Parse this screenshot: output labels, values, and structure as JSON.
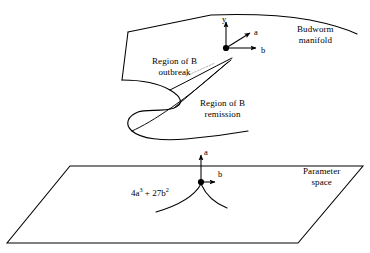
{
  "figure": {
    "stroke_color": "#000000",
    "background_color": "#ffffff",
    "labels": {
      "budworm_manifold_line1": "Budworm",
      "budworm_manifold_line2": "manifold",
      "region_outbreak_line1": "Region of B",
      "region_outbreak_line2": "outbreak",
      "region_remission_line1": "Region of B",
      "region_remission_line2": "remission",
      "parameter_space_line1": "Parameter",
      "parameter_space_line2": "space",
      "cusp_equation_part1": "4a",
      "cusp_equation_exp1": "3",
      "cusp_equation_part2": " + 27b",
      "cusp_equation_exp2": "2"
    },
    "upper_axes": {
      "vertical_label": "y",
      "diagonal_label": "a",
      "horizontal_label": "b"
    },
    "lower_axes": {
      "vertical_label": "a",
      "horizontal_label": "b"
    }
  }
}
